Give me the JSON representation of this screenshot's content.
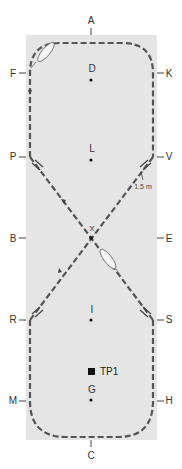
{
  "arena": {
    "fill": "#e5e5e5",
    "track_color": "#555555",
    "markers": {
      "A": "A",
      "C": "C",
      "F": "F",
      "K": "K",
      "P": "P",
      "V": "V",
      "B": "B",
      "E": "E",
      "R": "R",
      "S": "S",
      "M": "M",
      "H": "H"
    },
    "points": {
      "D": "D",
      "L": "L",
      "X": "X",
      "I": "I",
      "G": "G"
    },
    "transition_point": "TP1",
    "distance_label": "1.5 m"
  }
}
